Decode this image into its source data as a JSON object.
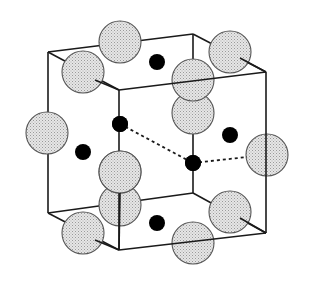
{
  "diagram": {
    "type": "crystal-unit-cell",
    "colors": {
      "background": "#ffffff",
      "edge": "#1a1a1a",
      "large_atom_fill": "#dcdcdc",
      "large_atom_stroke": "#555555",
      "small_atom_fill": "#000000"
    },
    "cube": {
      "vertices": {
        "back_top_left": [
          48,
          52
        ],
        "back_top_right": [
          193,
          34
        ],
        "front_top_left": [
          119,
          90
        ],
        "front_top_right": [
          266,
          72
        ],
        "back_bottom_left": [
          48,
          213
        ],
        "back_bottom_right": [
          193,
          193
        ],
        "front_bottom_left": [
          119,
          250
        ],
        "front_bottom_right": [
          266,
          233
        ]
      }
    },
    "large_atoms": [
      {
        "x": 120,
        "y": 42
      },
      {
        "x": 230,
        "y": 52
      },
      {
        "x": 193,
        "y": 113
      },
      {
        "x": 47,
        "y": 133
      },
      {
        "x": 267,
        "y": 155
      },
      {
        "x": 120,
        "y": 205
      },
      {
        "x": 230,
        "y": 212
      },
      {
        "x": 83,
        "y": 72
      },
      {
        "x": 193,
        "y": 80
      },
      {
        "x": 120,
        "y": 172
      },
      {
        "x": 83,
        "y": 233
      },
      {
        "x": 193,
        "y": 243
      }
    ],
    "large_atom_radius": 21,
    "small_atoms": [
      {
        "x": 157,
        "y": 62
      },
      {
        "x": 120,
        "y": 124
      },
      {
        "x": 230,
        "y": 135
      },
      {
        "x": 83,
        "y": 152
      },
      {
        "x": 193,
        "y": 163
      },
      {
        "x": 157,
        "y": 223
      }
    ],
    "small_atom_radius": 8,
    "bonds_dashed": [
      {
        "from": [
          120,
          124
        ],
        "to": [
          193,
          163
        ]
      },
      {
        "from": [
          193,
          163
        ],
        "to": [
          247,
          157
        ]
      }
    ]
  }
}
